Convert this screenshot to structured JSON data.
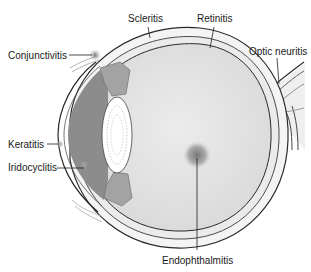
{
  "diagram": {
    "labels": {
      "conjunctivitis": "Conjunctivitis",
      "scleritis": "Scleritis",
      "retinitis": "Retinitis",
      "optic_neuritis": "Optic neuritis",
      "keratitis": "Keratitis",
      "iridocyclitis": "Iridocyclitis",
      "endophthalmitis": "Endophthalmitis"
    },
    "colors": {
      "background": "#ffffff",
      "vitreous": "#e2e2e2",
      "sclera": "#f2f2f2",
      "outline": "#2a2a2a",
      "anterior_chamber": "#8a8a8a",
      "lens": "#ffffff",
      "inflammation_spot": "#7a7a7a"
    }
  }
}
